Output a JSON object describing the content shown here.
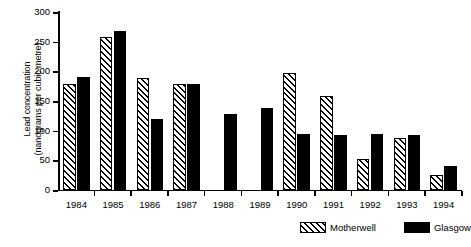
{
  "chart_data": {
    "type": "bar",
    "title": "",
    "xlabel": "",
    "ylabel": "Lead concentration (nanograms per cubic metre)",
    "ylabel_line1": "Lead concentration",
    "ylabel_line2": "(nanograms per cubic metre)",
    "categories": [
      "1984",
      "1985",
      "1986",
      "1987",
      "1988",
      "1989",
      "1990",
      "1991",
      "1992",
      "1993",
      "1994"
    ],
    "series": [
      {
        "name": "Motherwell",
        "pattern": "diagonal-hatch",
        "values": [
          178,
          258,
          188,
          178,
          null,
          null,
          198,
          159,
          52,
          87,
          25
        ]
      },
      {
        "name": "Glasgow",
        "pattern": "solid-black",
        "values": [
          190,
          268,
          120,
          178,
          128,
          139,
          95,
          92,
          94,
          92,
          41
        ]
      }
    ],
    "ylim": [
      0,
      300
    ],
    "yticks": [
      0,
      50,
      100,
      150,
      200,
      250,
      300
    ],
    "ytick_labels": [
      "0",
      "50",
      "100",
      "150",
      "200",
      "250",
      "300"
    ],
    "grid": false,
    "legend_position": "bottom-right"
  },
  "legend": {
    "items": [
      {
        "label": "Motherwell",
        "swatch": "hatched-swatch"
      },
      {
        "label": "Glasgow",
        "swatch": "solid-black-swatch"
      }
    ]
  },
  "colors": {
    "series_motherwell": "#ffffff",
    "series_motherwell_hatch": "#000000",
    "series_glasgow": "#000000",
    "axis": "#000000",
    "background": "#ffffff"
  }
}
